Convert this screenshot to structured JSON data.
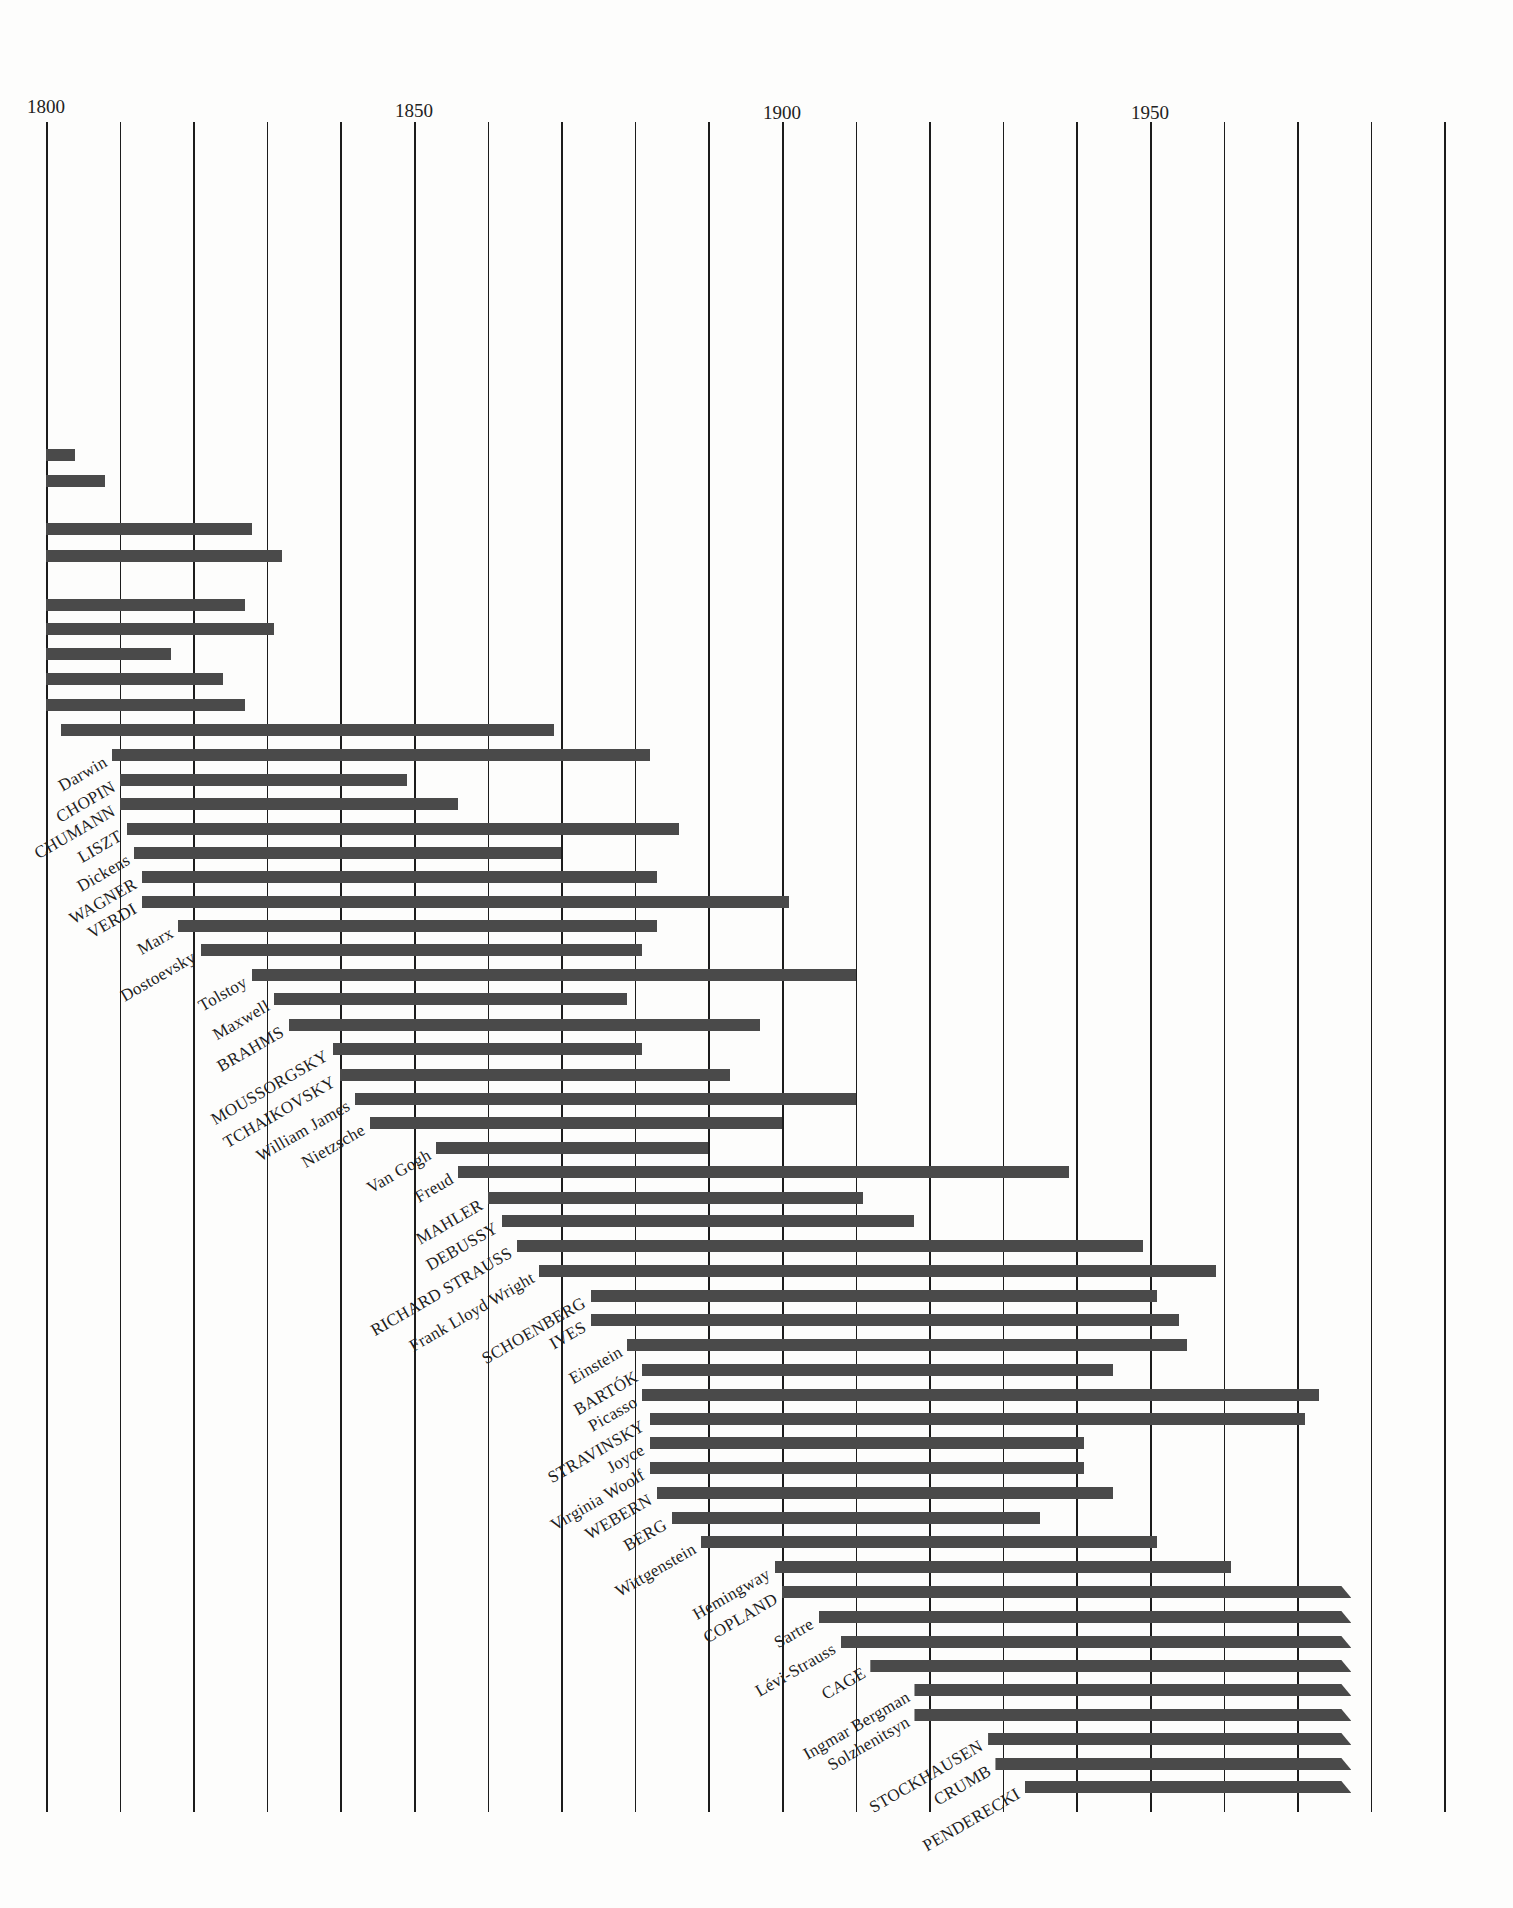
{
  "chart_data": {
    "type": "bar",
    "subtype": "horizontal-timeline",
    "title": "",
    "xlabel": "",
    "ylabel": "",
    "xlim": [
      1800,
      1990
    ],
    "grid": true,
    "grid_interval_years": 10,
    "tick_labels": [
      "1800",
      "1850",
      "1900",
      "1950"
    ],
    "ticks": [
      1800,
      1850,
      1900,
      1950
    ],
    "bar_color": "#4a4a4a",
    "note": "Uppercase names are composers; ongoing lives shown with slanted arrow tips; top rows begin before 1800 and their labels are cropped",
    "series": [
      {
        "name": "",
        "start": 1800,
        "end": 1804,
        "ongoing": false,
        "cropped": true
      },
      {
        "name": "",
        "start": 1800,
        "end": 1808,
        "ongoing": false,
        "cropped": true
      },
      {
        "name": "",
        "start": 1800,
        "end": 1828,
        "ongoing": false,
        "cropped": true
      },
      {
        "name": "",
        "start": 1800,
        "end": 1832,
        "ongoing": false,
        "cropped": true
      },
      {
        "name": "",
        "start": 1800,
        "end": 1827,
        "ongoing": false,
        "cropped": true
      },
      {
        "name": "",
        "start": 1800,
        "end": 1831,
        "ongoing": false,
        "cropped": true
      },
      {
        "name": "",
        "start": 1800,
        "end": 1817,
        "ongoing": false,
        "cropped": true
      },
      {
        "name": "",
        "start": 1800,
        "end": 1824,
        "ongoing": false,
        "cropped": true
      },
      {
        "name": "",
        "start": 1800,
        "end": 1827,
        "ongoing": false,
        "cropped": true
      },
      {
        "name": "",
        "start": 1802,
        "end": 1869,
        "ongoing": false,
        "cropped": true
      },
      {
        "name": "Darwin",
        "start": 1809,
        "end": 1882
      },
      {
        "name": "CHOPIN",
        "start": 1810,
        "end": 1849
      },
      {
        "name": "SCHUMANN",
        "display": "CHUMANN",
        "start": 1810,
        "end": 1856
      },
      {
        "name": "LISZT",
        "start": 1811,
        "end": 1886
      },
      {
        "name": "Dickens",
        "start": 1812,
        "end": 1870
      },
      {
        "name": "WAGNER",
        "start": 1813,
        "end": 1883
      },
      {
        "name": "VERDI",
        "start": 1813,
        "end": 1901
      },
      {
        "name": "Marx",
        "start": 1818,
        "end": 1883
      },
      {
        "name": "Dostoevsky",
        "start": 1821,
        "end": 1881
      },
      {
        "name": "Tolstoy",
        "start": 1828,
        "end": 1910
      },
      {
        "name": "Maxwell",
        "start": 1831,
        "end": 1879
      },
      {
        "name": "BRAHMS",
        "start": 1833,
        "end": 1897
      },
      {
        "name": "MOUSSORGSKY",
        "start": 1839,
        "end": 1881
      },
      {
        "name": "TCHAIKOVSKY",
        "start": 1840,
        "end": 1893
      },
      {
        "name": "William James",
        "start": 1842,
        "end": 1910
      },
      {
        "name": "Nietzsche",
        "start": 1844,
        "end": 1900
      },
      {
        "name": "Van Gogh",
        "start": 1853,
        "end": 1890
      },
      {
        "name": "Freud",
        "start": 1856,
        "end": 1939
      },
      {
        "name": "MAHLER",
        "start": 1860,
        "end": 1911
      },
      {
        "name": "DEBUSSY",
        "start": 1862,
        "end": 1918
      },
      {
        "name": "RICHARD STRAUSS",
        "start": 1864,
        "end": 1949
      },
      {
        "name": "Frank Lloyd Wright",
        "start": 1867,
        "end": 1959
      },
      {
        "name": "SCHOENBERG",
        "start": 1874,
        "end": 1951
      },
      {
        "name": "IVES",
        "start": 1874,
        "end": 1954
      },
      {
        "name": "Einstein",
        "start": 1879,
        "end": 1955
      },
      {
        "name": "BARTÓK",
        "start": 1881,
        "end": 1945
      },
      {
        "name": "Picasso",
        "start": 1881,
        "end": 1973
      },
      {
        "name": "STRAVINSKY",
        "start": 1882,
        "end": 1971
      },
      {
        "name": "Joyce",
        "start": 1882,
        "end": 1941
      },
      {
        "name": "Virginia Woolf",
        "start": 1882,
        "end": 1941
      },
      {
        "name": "WEBERN",
        "start": 1883,
        "end": 1945
      },
      {
        "name": "BERG",
        "start": 1885,
        "end": 1935
      },
      {
        "name": "Wittgenstein",
        "start": 1889,
        "end": 1951
      },
      {
        "name": "Hemingway",
        "start": 1899,
        "end": 1961
      },
      {
        "name": "COPLAND",
        "start": 1900,
        "end": 1976,
        "ongoing": true
      },
      {
        "name": "Sartre",
        "start": 1905,
        "end": 1976,
        "ongoing": true
      },
      {
        "name": "Lévi-Strauss",
        "start": 1908,
        "end": 1976,
        "ongoing": true
      },
      {
        "name": "CAGE",
        "start": 1912,
        "end": 1976,
        "ongoing": true
      },
      {
        "name": "Ingmar Bergman",
        "start": 1918,
        "end": 1976,
        "ongoing": true
      },
      {
        "name": "Solzhenitsyn",
        "start": 1918,
        "end": 1976,
        "ongoing": true
      },
      {
        "name": "STOCKHAUSEN",
        "start": 1928,
        "end": 1976,
        "ongoing": true
      },
      {
        "name": "CRUMB",
        "start": 1929,
        "end": 1976,
        "ongoing": true
      },
      {
        "name": "PENDERECKI",
        "start": 1933,
        "end": 1976,
        "ongoing": true
      }
    ]
  },
  "layout": {
    "x0_px": 46,
    "px_per_year": 7.36,
    "grid_top": 122,
    "grid_bottom": 1812,
    "row_y": [
      455,
      481,
      529,
      556,
      605,
      629,
      654,
      679,
      705,
      730,
      755,
      780,
      804,
      829,
      853,
      877,
      902,
      926,
      950,
      975,
      999,
      1025,
      1049,
      1075,
      1099,
      1123,
      1148,
      1172,
      1198,
      1221,
      1246,
      1271,
      1296,
      1320,
      1345,
      1370,
      1395,
      1419,
      1443,
      1468,
      1493,
      1518,
      1542,
      1567,
      1592,
      1617,
      1642,
      1666,
      1690,
      1715,
      1739,
      1764,
      1787
    ]
  }
}
